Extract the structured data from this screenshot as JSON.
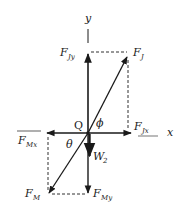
{
  "diagram": {
    "type": "free-body force diagram",
    "origin_label": "Q",
    "axes": {
      "x_label": "x",
      "y_label": "y"
    },
    "forces": [
      {
        "id": "FJ",
        "symbol": "F",
        "subscript": "J",
        "direction": "up-right"
      },
      {
        "id": "FJy",
        "symbol": "F",
        "subscript": "Jy",
        "direction": "up"
      },
      {
        "id": "FJx",
        "symbol": "F",
        "subscript": "Jx",
        "direction": "right"
      },
      {
        "id": "FM",
        "symbol": "F",
        "subscript": "M",
        "direction": "down-left"
      },
      {
        "id": "FMx",
        "symbol": "F",
        "subscript": "Mx",
        "direction": "left"
      },
      {
        "id": "FMy",
        "symbol": "F",
        "subscript": "My",
        "direction": "down"
      },
      {
        "id": "W2",
        "symbol": "W",
        "subscript": "2",
        "direction": "down"
      }
    ],
    "angles": {
      "phi": "ϕ",
      "theta": "θ"
    },
    "colors": {
      "ink": "#1a1a1a",
      "background": "#ffffff"
    }
  }
}
